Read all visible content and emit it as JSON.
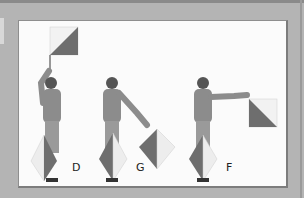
{
  "figure": {
    "colors": {
      "frame": "#b4b4b4",
      "panel": "#fbfbfb",
      "flag_dark": "#6e6e6e",
      "flag_light": "#f2f2f2",
      "person": "#8c8c8c"
    },
    "signals": [
      {
        "letter": "D"
      },
      {
        "letter": "G"
      },
      {
        "letter": "F"
      }
    ]
  }
}
